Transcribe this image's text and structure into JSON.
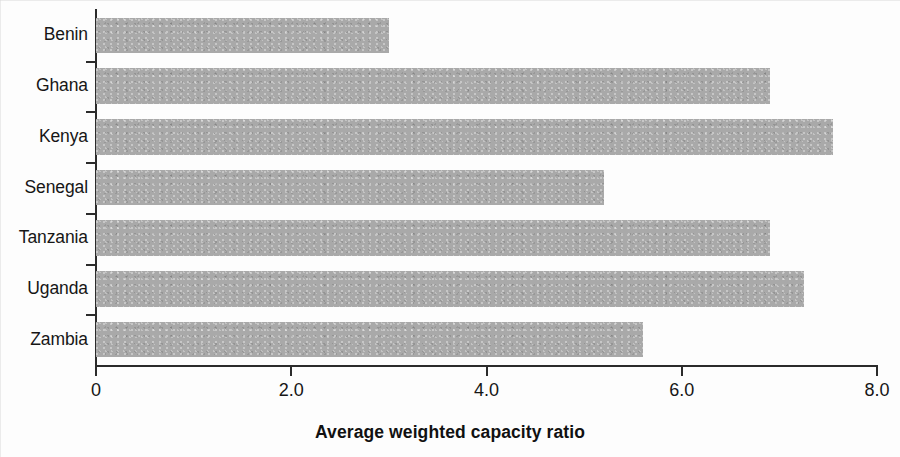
{
  "chart_data": {
    "type": "bar",
    "orientation": "horizontal",
    "title": "",
    "xlabel": "Average weighted capacity ratio",
    "ylabel": "",
    "categories": [
      "Benin",
      "Ghana",
      "Kenya",
      "Senegal",
      "Tanzania",
      "Uganda",
      "Zambia"
    ],
    "values": [
      3.0,
      6.9,
      7.55,
      5.2,
      6.9,
      7.25,
      5.6
    ],
    "series": [
      {
        "name": "Average weighted capacity ratio",
        "values": [
          3.0,
          6.9,
          7.55,
          5.2,
          6.9,
          7.25,
          5.6
        ]
      }
    ],
    "xlim": [
      0,
      8.0
    ],
    "xticks": [
      0,
      2.0,
      4.0,
      6.0,
      8.0
    ],
    "xtick_labels": [
      "0",
      "2.0",
      "4.0",
      "6.0",
      "8.0"
    ],
    "grid": false,
    "legend": false,
    "bar_color": "#a9a9a9",
    "axis_color": "#2b2b2b"
  },
  "axis": {
    "x_title": "Average weighted capacity ratio"
  }
}
